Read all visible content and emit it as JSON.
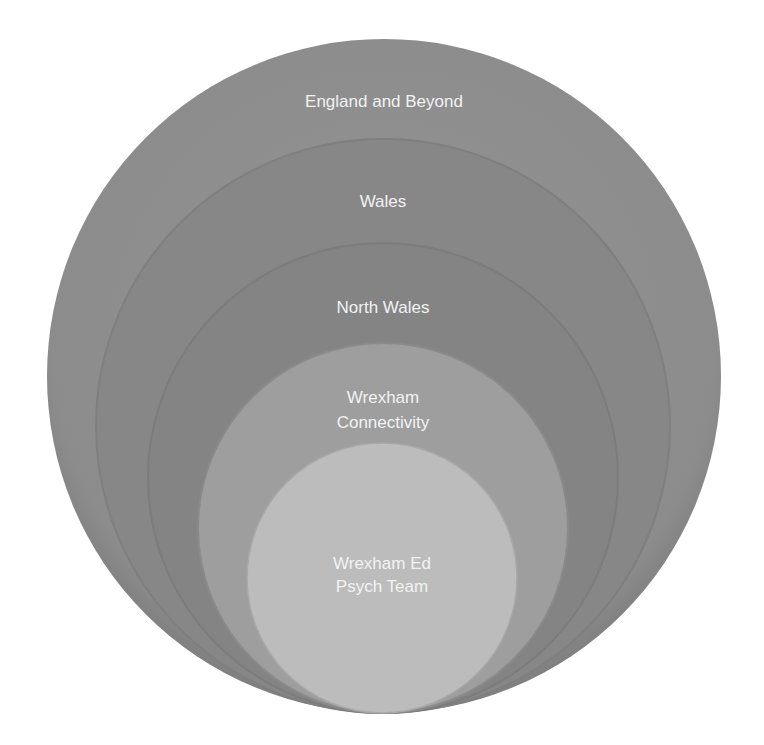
{
  "diagram": {
    "type": "nested-circles",
    "colors": {
      "background": "#ffffff",
      "label": "#f2f2f2"
    },
    "circles": [
      {
        "id": "england",
        "lines": [
          "England and Beyond"
        ],
        "cx": 384,
        "cy": 376,
        "r": 337,
        "fill": "#8e8e8e",
        "label_y": [
          107
        ]
      },
      {
        "id": "wales",
        "lines": [
          "Wales"
        ],
        "cx": 383,
        "cy": 426,
        "r": 287,
        "fill": "#878787",
        "label_y": [
          207
        ]
      },
      {
        "id": "north-wales",
        "lines": [
          "North Wales"
        ],
        "cx": 383,
        "cy": 478,
        "r": 235,
        "fill": "#838383",
        "label_y": [
          313
        ]
      },
      {
        "id": "wrexham-connectivity",
        "lines": [
          "Wrexham",
          "Connectivity"
        ],
        "cx": 383,
        "cy": 528,
        "r": 185,
        "fill": "#9d9d9d",
        "label_y": [
          403,
          428
        ]
      },
      {
        "id": "ed-psych-team",
        "lines": [
          "Wrexham Ed",
          "Psych Team"
        ],
        "cx": 382,
        "cy": 578,
        "r": 135,
        "fill": "#bababa",
        "label_y": [
          569,
          592
        ]
      }
    ]
  },
  "labels": {
    "england": "England and Beyond",
    "wales": "Wales",
    "north_wales": "North Wales",
    "wrexham_connectivity_line1": "Wrexham",
    "wrexham_connectivity_line2": "Connectivity",
    "ed_psych_line1": "Wrexham Ed",
    "ed_psych_line2": "Psych Team"
  }
}
